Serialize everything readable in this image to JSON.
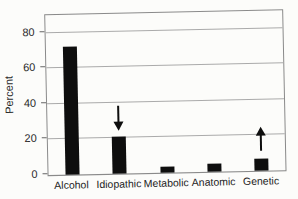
{
  "chart_data": {
    "type": "bar",
    "categories": [
      "Alcohol",
      "Idiopathic",
      "Metabolic",
      "Anatomic",
      "Genetic"
    ],
    "values": [
      72,
      21,
      3.5,
      4.5,
      6.5
    ],
    "title": "",
    "xlabel": "",
    "ylabel": "Percent",
    "ylim": [
      0,
      90
    ],
    "yticks": [
      0,
      20,
      40,
      60,
      80
    ],
    "grid": true,
    "legend": "none",
    "bar_color": "#0e0e0e",
    "gridline_color": "#aaaaaa",
    "frame_color": "#8a8a8a",
    "annotations": [
      {
        "type": "arrow-down",
        "category": "Idiopathic",
        "from_value": 38,
        "to_value": 24
      },
      {
        "type": "arrow-up",
        "category": "Genetic",
        "from_value": 11,
        "to_value": 25
      }
    ]
  }
}
